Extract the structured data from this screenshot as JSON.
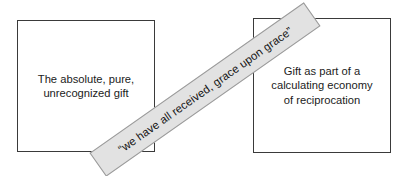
{
  "diagram": {
    "background_color": "#ffffff",
    "box_border_color": "#3a3a3a",
    "banner_fill_color": "#e2e2e2",
    "banner_border_color": "#9a9a9a",
    "text_color": "#1b1b1b",
    "left_box": {
      "text": "The absolute, pure,\nunrecognized gift"
    },
    "right_box": {
      "text": "Gift as part of a\ncalculating economy\nof reciprocation"
    },
    "banner": {
      "text": "“we have all received, grace upon grace”",
      "rotation_degrees": -35.1
    }
  }
}
